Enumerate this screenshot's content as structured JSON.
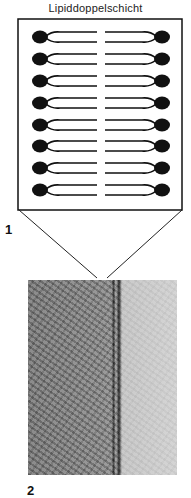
{
  "diagram": {
    "title": "Lipiddoppelschicht",
    "labels": {
      "figure_1": "1",
      "figure_2": "2"
    },
    "bilayer": {
      "rows": 8,
      "components": [
        "hydrophilic-head",
        "hydrophobic-tail"
      ]
    },
    "micrograph": {
      "description": "electron micrograph of membrane"
    },
    "colors": {
      "ink": "#111111",
      "background": "#ffffff"
    }
  }
}
